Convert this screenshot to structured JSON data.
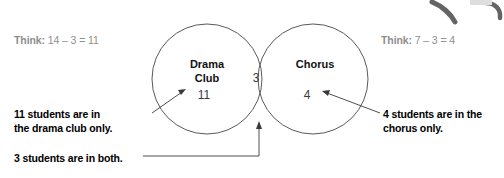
{
  "diagram": {
    "title_left": "Drama\nClub",
    "circles": [
      {
        "name": "drama-club",
        "label_line1": "Drama",
        "label_line2": "Club",
        "count": "11"
      },
      {
        "name": "chorus",
        "label_line1": "Chorus",
        "label_line2": "",
        "count": "4"
      }
    ],
    "intersection_count": "3",
    "left_circle_label_line1": "Drama",
    "left_circle_label_line2": "Club",
    "right_circle_label": "Chorus",
    "left_count": "11",
    "right_count": "4",
    "both_count": "3",
    "stroke_color": "#555555",
    "label_color": "#111111",
    "count_color": "#3a3a3a"
  },
  "think_left": {
    "prefix": "Think:",
    "equation": "14 – 3 = 11",
    "color": "#8e8e8e"
  },
  "think_right": {
    "prefix": "Think:",
    "equation": "7 – 3 = 4",
    "color": "#8e8e8e"
  },
  "captions": {
    "drama_only_line1": "11 students are in",
    "drama_only_line2": "the drama club only.",
    "chorus_only_line1": "4 students are in the",
    "chorus_only_line2": "chorus only.",
    "both": "3 students are in both.",
    "color": "#000000"
  },
  "decoration": {
    "corner_artifact_name": "cropped-illustration-fragment",
    "color": "#4a4a4a"
  }
}
